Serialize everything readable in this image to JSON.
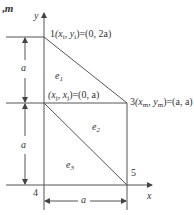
{
  "header": {
    "fragment": ",",
    "fragment_var": "m"
  },
  "axes": {
    "x_label": "x",
    "y_label": "y"
  },
  "nodes": {
    "n1": {
      "id": "1",
      "coord_label": "(x",
      "sub1": "i",
      "mid": ", y",
      "sub2": "i",
      "value": ")=(0, 2a)"
    },
    "n2": {
      "coord_label": "(x",
      "sub1": "j",
      "mid": ", x",
      "sub2": "j",
      "value": ")=(0, a)"
    },
    "n3": {
      "id": "3",
      "coord_label": "(x",
      "sub1": "m",
      "mid": ", y",
      "sub2": "m",
      "value": ")=(a, a)"
    },
    "n4": {
      "id": "4"
    },
    "n5": {
      "id": "5"
    }
  },
  "elements": [
    {
      "name": "e",
      "sub": "1"
    },
    {
      "name": "e",
      "sub": "2"
    },
    {
      "name": "e",
      "sub": "3"
    }
  ],
  "dimensions": {
    "upper_vertical": "a",
    "lower_vertical": "a",
    "bottom_horizontal": "a"
  },
  "colors": {
    "line": "#555555",
    "text": "#333333"
  }
}
